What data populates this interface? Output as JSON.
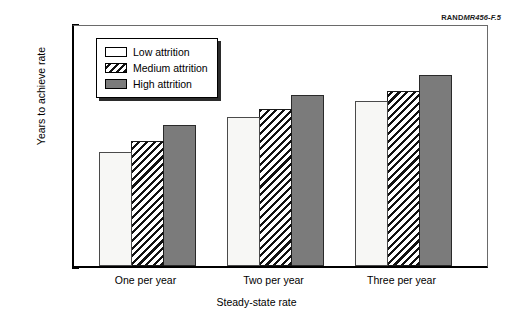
{
  "figure_id": {
    "prefix": "RAND",
    "number": "MR456-F.5",
    "full": "RANDMR456-F.5"
  },
  "chart_data": {
    "type": "bar",
    "title": "",
    "subtitle": "",
    "xlabel": "Steady-state rate",
    "ylabel": "Years to achieve rate",
    "categories": [
      "One per year",
      "Two per year",
      "Three per year"
    ],
    "series": [
      {
        "name": "Low attrition",
        "values": [
          11.7,
          15.3,
          17.0
        ],
        "fill": "white",
        "color": "#f7f7f5"
      },
      {
        "name": "Medium attrition",
        "values": [
          12.9,
          16.2,
          18.0
        ],
        "fill": "hatch",
        "color": "#ffffff"
      },
      {
        "name": "High attrition",
        "values": [
          14.5,
          17.6,
          19.7
        ],
        "fill": "solid",
        "color": "#7b7b7b"
      }
    ],
    "ylim": [
      0,
      25
    ],
    "yticks": [
      0,
      5,
      10,
      15,
      20,
      25
    ],
    "ytick_labels": [
      "0",
      "5",
      "10",
      "15",
      "20",
      "25"
    ],
    "grid": false,
    "legend_position": "upper-left-inside",
    "legend_entries": [
      "Low attrition",
      "Medium attrition",
      "High attrition"
    ]
  }
}
